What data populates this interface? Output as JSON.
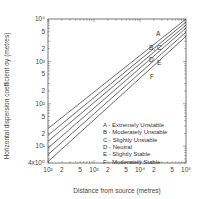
{
  "chart_data": {
    "type": "line",
    "title": "",
    "xlabel": "Distance from source (metres)",
    "ylabel": "Horizontal dispersion coefficient σy (metres)",
    "xscale": "log",
    "yscale": "log",
    "xlim": [
      100,
      100000
    ],
    "ylim": [
      4,
      10000
    ],
    "x_ticks": [
      {
        "value": 100,
        "label": "10²"
      },
      {
        "value": 200,
        "label": "2"
      },
      {
        "value": 500,
        "label": "5"
      },
      {
        "value": 1000,
        "label": "10³"
      },
      {
        "value": 2000,
        "label": "2"
      },
      {
        "value": 5000,
        "label": "5"
      },
      {
        "value": 10000,
        "label": "10⁴"
      },
      {
        "value": 20000,
        "label": "2"
      },
      {
        "value": 50000,
        "label": "5"
      },
      {
        "value": 100000,
        "label": "10⁵"
      }
    ],
    "y_ticks": [
      {
        "value": 4,
        "label": "4x10⁰"
      },
      {
        "value": 10,
        "label": "10¹"
      },
      {
        "value": 20,
        "label": "2"
      },
      {
        "value": 50,
        "label": "5"
      },
      {
        "value": 100,
        "label": "10²"
      },
      {
        "value": 200,
        "label": "2"
      },
      {
        "value": 500,
        "label": "5"
      },
      {
        "value": 1000,
        "label": "10³"
      },
      {
        "value": 2000,
        "label": "2"
      },
      {
        "value": 5000,
        "label": "5"
      },
      {
        "value": 10000,
        "label": "10⁴"
      }
    ],
    "x": [
      100,
      100000
    ],
    "series": [
      {
        "name": "A",
        "label": "A - Extremely Unstable",
        "values": [
          26,
          10000
        ]
      },
      {
        "name": "B",
        "label": "B - Moderately Unstable",
        "values": [
          18,
          8500
        ]
      },
      {
        "name": "C",
        "label": "C - Slightly Unstable",
        "values": [
          13,
          7200
        ]
      },
      {
        "name": "D",
        "label": "D - Neutral",
        "values": [
          9,
          6100
        ]
      },
      {
        "name": "E",
        "label": "E - Slightly Stable",
        "values": [
          6.3,
          4900
        ]
      },
      {
        "name": "F",
        "label": "F - Moderately Stable",
        "values": [
          4.3,
          3900
        ]
      }
    ],
    "curve_labels": [
      {
        "text": "A",
        "x": 156,
        "y": 36
      },
      {
        "text": "B, C",
        "x": 149,
        "y": 50
      },
      {
        "text": "D",
        "x": 149,
        "y": 62
      },
      {
        "text": "E",
        "x": 157,
        "y": 65
      },
      {
        "text": "F",
        "x": 150,
        "y": 79
      }
    ],
    "legend_position": "lower right inside plot",
    "grid": false
  },
  "legend": [
    "A - Extremely Unstable",
    "B - Moderately Unstable",
    "C - Slightly Unstable",
    "D - Neutral",
    "E - Slightly Stable",
    "F - Moderately Stable"
  ],
  "colors": {
    "line": "#444444",
    "axis": "#555555",
    "background": "#ffffff"
  }
}
